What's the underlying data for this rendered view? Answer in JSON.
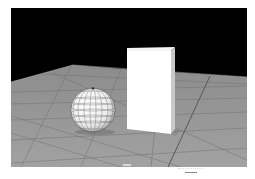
{
  "viewport": {
    "name": "3D perspective viewport",
    "background_color": "#000000",
    "floor_color": "#9a9a9a",
    "grid_line_color": "#6e6e6e",
    "axis_indicator": "",
    "objects": [
      {
        "type": "sphere",
        "shading": "white with wireframe grid",
        "color": "#f2f2f2"
      },
      {
        "type": "box",
        "shading": "white",
        "color": "#ffffff"
      },
      {
        "type": "ground-plane",
        "shading": "grey grid"
      }
    ]
  },
  "footer": {
    "marker": ""
  }
}
